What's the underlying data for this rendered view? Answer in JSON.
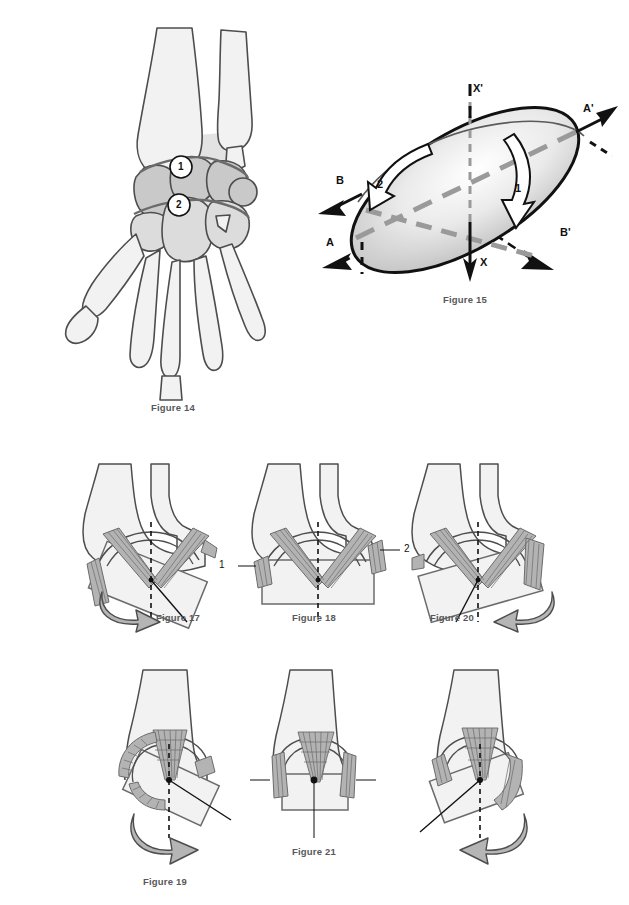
{
  "plate": {
    "title": "Wrist joint kinematics figure plate",
    "background_color": "#ffffff"
  },
  "palette": {
    "bone_fill": "#f2f2f2",
    "bone_stroke": "#4d4d4d",
    "carpal_mid_fill": "#c9c9c9",
    "carpal_light_fill": "#dcdcdc",
    "ligament_fill": "#b3b3b3",
    "ligament_stroke": "#6b6b6b",
    "arrow_grey_fill": "#b5b5b5",
    "arrow_grey_stroke": "#4d4d4d",
    "dashed_axis_grey": "#9a9a9a",
    "caption_color": "#58585a",
    "black": "#111111"
  },
  "figures": [
    {
      "id": "figure-14",
      "caption": "Figure 14",
      "caption_x": 173,
      "caption_y": 408,
      "description": "Dorsal view of carpal bones with shaded proximal and distal carpal rows",
      "callouts": [
        {
          "label": "1",
          "x": 181,
          "y": 167
        },
        {
          "label": "2",
          "x": 179,
          "y": 205
        }
      ]
    },
    {
      "id": "figure-15",
      "caption": "Figure 15",
      "caption_x": 465,
      "caption_y": 300,
      "description": "Ellipsoid with three orthogonal axes and two rotation arrows",
      "axis_labels": [
        {
          "label": "X'",
          "x": 473,
          "y": 88
        },
        {
          "label": "X",
          "x": 473,
          "y": 262
        },
        {
          "label": "A'",
          "x": 583,
          "y": 110
        },
        {
          "label": "A",
          "x": 328,
          "y": 243
        },
        {
          "label": "B",
          "x": 337,
          "y": 181
        },
        {
          "label": "B'",
          "x": 561,
          "y": 233
        }
      ],
      "rotation_labels": [
        {
          "label": "1",
          "x": 515,
          "y": 188
        },
        {
          "label": "2",
          "x": 409,
          "y": 180
        }
      ]
    },
    {
      "id": "figure-17",
      "caption": "Figure 17",
      "caption_x": 178,
      "caption_y": 618,
      "description": "Distal segment tilted in radial deviation with curved arrow to the lower left"
    },
    {
      "id": "figure-16",
      "caption": "Figure 16",
      "caption_x": 314,
      "caption_y": 618,
      "description": "Neutral frontal view with collateral ligaments labelled 1 and 2",
      "callouts": [
        {
          "label": "1",
          "x": 221,
          "y": 547
        },
        {
          "label": "2",
          "x": 367,
          "y": 527
        }
      ]
    },
    {
      "id": "figure-18",
      "caption": "Figure 18",
      "caption_x": 452,
      "caption_y": 618,
      "description": "Distal segment tilted in ulnar deviation with curved arrow to the lower right"
    },
    {
      "id": "figure-20",
      "caption": "Figure 20",
      "caption_x": 165,
      "caption_y": 882,
      "description": "Lateral view in extension with curved arrow at base"
    },
    {
      "id": "figure-19",
      "caption": "Figure 19",
      "caption_x": 314,
      "caption_y": 852,
      "description": "Lateral neutral view with ligaments labelled 3 and 4",
      "callouts": [
        {
          "label": "4",
          "x": 252,
          "y": 781
        },
        {
          "label": "3",
          "x": 364,
          "y": 781
        }
      ]
    },
    {
      "id": "figure-21",
      "caption": "Figure 21",
      "caption_x": 470,
      "caption_y": 882,
      "description": "Lateral view in flexion with curved arrow at base"
    }
  ]
}
